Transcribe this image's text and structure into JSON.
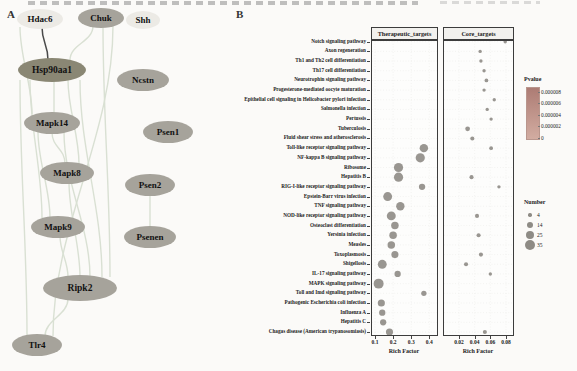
{
  "figure": {
    "panel_a_label": "A",
    "panel_b_label": "B"
  },
  "network": {
    "node_fill_default": "#a6a39b",
    "node_fill_dark": "#8a8774",
    "node_fill_light": "#eceae5",
    "node_text_color": "#111111",
    "edge_color": "#d9e0d3",
    "edge_color_dark": "#4a4a4a",
    "nodes": [
      {
        "id": "Hdac6",
        "x": 40,
        "y": 19,
        "rx": 23,
        "ry": 10,
        "variant": "light"
      },
      {
        "id": "Chuk",
        "x": 101,
        "y": 18,
        "rx": 23,
        "ry": 10,
        "variant": "default"
      },
      {
        "id": "Shh",
        "x": 143,
        "y": 20,
        "rx": 17,
        "ry": 9,
        "variant": "light"
      },
      {
        "id": "Hsp90aa1",
        "x": 52,
        "y": 70,
        "rx": 34,
        "ry": 12,
        "variant": "dark"
      },
      {
        "id": "Ncstn",
        "x": 143,
        "y": 80,
        "rx": 26,
        "ry": 11,
        "variant": "default"
      },
      {
        "id": "Mapk14",
        "x": 52,
        "y": 123,
        "rx": 28,
        "ry": 11,
        "variant": "default"
      },
      {
        "id": "Psen1",
        "x": 168,
        "y": 132,
        "rx": 25,
        "ry": 11,
        "variant": "default"
      },
      {
        "id": "Mapk8",
        "x": 67,
        "y": 173,
        "rx": 27,
        "ry": 11,
        "variant": "default"
      },
      {
        "id": "Psen2",
        "x": 150,
        "y": 185,
        "rx": 25,
        "ry": 11,
        "variant": "default"
      },
      {
        "id": "Mapk9",
        "x": 58,
        "y": 227,
        "rx": 27,
        "ry": 11,
        "variant": "default"
      },
      {
        "id": "Psenen",
        "x": 150,
        "y": 237,
        "rx": 26,
        "ry": 11,
        "variant": "default"
      },
      {
        "id": "Ripk2",
        "x": 80,
        "y": 288,
        "rx": 37,
        "ry": 13,
        "variant": "default"
      },
      {
        "id": "Tlr4",
        "x": 37,
        "y": 345,
        "rx": 25,
        "ry": 11,
        "variant": "default"
      }
    ],
    "edges": [
      {
        "from": "Hdac6",
        "to": "Hsp90aa1",
        "o1": 2,
        "o2": -4,
        "dark": true
      },
      {
        "from": "Chuk",
        "to": "Hsp90aa1",
        "o1": -8,
        "o2": 18
      },
      {
        "from": "Hsp90aa1",
        "to": "Mapk14",
        "o1": 2,
        "o2": 2
      },
      {
        "from": "Hsp90aa1",
        "to": "Mapk8",
        "o1": 16,
        "o2": 12
      },
      {
        "from": "Hsp90aa1",
        "to": "Mapk9",
        "o1": -22,
        "o2": -16
      },
      {
        "from": "Hsp90aa1",
        "to": "Ripk2",
        "o1": 28,
        "o2": 22
      },
      {
        "from": "Hsp90aa1",
        "to": "Tlr4",
        "o1": -32,
        "o2": -10
      },
      {
        "from": "Chuk",
        "to": "Ripk2",
        "o1": 2,
        "o2": 30
      },
      {
        "from": "Chuk",
        "to": "Tlr4",
        "o1": 12,
        "o2": 16
      },
      {
        "from": "Mapk14",
        "to": "Mapk8",
        "o1": 0,
        "o2": -2
      },
      {
        "from": "Mapk14",
        "to": "Mapk9",
        "o1": -14,
        "o2": -8
      },
      {
        "from": "Mapk14",
        "to": "Ripk2",
        "o1": 12,
        "o2": 10
      },
      {
        "from": "Mapk8",
        "to": "Ripk2",
        "o1": 2,
        "o2": 0
      },
      {
        "from": "Mapk9",
        "to": "Ripk2",
        "o1": 2,
        "o2": -12
      },
      {
        "from": "Ripk2",
        "to": "Tlr4",
        "o1": -12,
        "o2": 8
      },
      {
        "from": "Hdac6",
        "to": "Mapk14",
        "o1": -20,
        "o2": -20
      },
      {
        "from": "Psen2",
        "to": "Psenen",
        "o1": 0,
        "o2": 0
      }
    ]
  },
  "chart_data": {
    "type": "scatter",
    "title": "",
    "grid": true,
    "point_color": "#8e8b85",
    "facets": [
      {
        "label": "Therapeutic_targets",
        "xlabel": "Rich Factor",
        "x_ticks": [
          0.1,
          0.2,
          0.3,
          0.4
        ],
        "xlim": [
          0.08,
          0.45
        ]
      },
      {
        "label": "Core_targets",
        "xlabel": "Rich Factor",
        "x_ticks": [
          0.02,
          0.04,
          0.06,
          0.08
        ],
        "xlim": [
          0.013,
          0.09
        ]
      }
    ],
    "categories": [
      "Notch signaling pathway",
      "Axon regeneration",
      "Th1 and Th2 cell differentiation",
      "Th17 cell differentiation",
      "Neurotrophin signaling pathway",
      "Progesterone-mediated oocyte maturation",
      "Epithelial cell signaling in Helicobacter pylori infection",
      "Salmonella infection",
      "Pertussis",
      "Tuberculosis",
      "Fluid shear stress and atherosclerosis",
      "Toll-like receptor signaling pathway",
      "NF-kappa B signaling pathway",
      "Ribosome",
      "Hepatitis B",
      "RIG-I-like receptor signaling pathway",
      "Epstein-Barr virus infection",
      "TNF signaling pathway",
      "NOD-like receptor signaling pathway",
      "Osteoclast differentiation",
      "Yersinia infection",
      "Measles",
      "Toxoplasmosis",
      "Shigellosis",
      "IL-17 signaling pathway",
      "MAPK signaling pathway",
      "Toll and Imd signaling pathway",
      "Pathogenic Escherichia coli infection",
      "Influenza A",
      "Hepatitis C",
      "Chagas disease (American trypanosomiasis)"
    ],
    "series": [
      {
        "name": "Therapeutic_targets",
        "points": [
          {
            "pathway": "Toll-like receptor signaling pathway",
            "rich_factor": 0.37,
            "number": 25
          },
          {
            "pathway": "NF-kappa B signaling pathway",
            "rich_factor": 0.35,
            "number": 30
          },
          {
            "pathway": "Ribosome",
            "rich_factor": 0.23,
            "number": 30
          },
          {
            "pathway": "Hepatitis B",
            "rich_factor": 0.23,
            "number": 30
          },
          {
            "pathway": "RIG-I-like receptor signaling pathway",
            "rich_factor": 0.36,
            "number": 14
          },
          {
            "pathway": "Epstein-Barr virus infection",
            "rich_factor": 0.17,
            "number": 28
          },
          {
            "pathway": "TNF signaling pathway",
            "rich_factor": 0.24,
            "number": 25
          },
          {
            "pathway": "NOD-like receptor signaling pathway",
            "rich_factor": 0.19,
            "number": 28
          },
          {
            "pathway": "Osteoclast differentiation",
            "rich_factor": 0.21,
            "number": 20
          },
          {
            "pathway": "Yersinia infection",
            "rich_factor": 0.2,
            "number": 20
          },
          {
            "pathway": "Measles",
            "rich_factor": 0.19,
            "number": 20
          },
          {
            "pathway": "Toxoplasmosis",
            "rich_factor": 0.21,
            "number": 18
          },
          {
            "pathway": "Shigellosis",
            "rich_factor": 0.14,
            "number": 28
          },
          {
            "pathway": "IL-17 signaling pathway",
            "rich_factor": 0.225,
            "number": 14
          },
          {
            "pathway": "MAPK signaling pathway",
            "rich_factor": 0.12,
            "number": 35
          },
          {
            "pathway": "Toll and Imd signaling pathway",
            "rich_factor": 0.37,
            "number": 10
          },
          {
            "pathway": "Pathogenic Escherichia coli infection",
            "rich_factor": 0.135,
            "number": 18
          },
          {
            "pathway": "Influenza A",
            "rich_factor": 0.14,
            "number": 14
          },
          {
            "pathway": "Hepatitis C",
            "rich_factor": 0.145,
            "number": 14
          },
          {
            "pathway": "Chagas disease (American trypanosomiasis)",
            "rich_factor": 0.18,
            "number": 18
          }
        ]
      },
      {
        "name": "Core_targets",
        "points": [
          {
            "pathway": "Notch signaling pathway",
            "rich_factor": 0.079,
            "number": 4
          },
          {
            "pathway": "Axon regeneration",
            "rich_factor": 0.047,
            "number": 4
          },
          {
            "pathway": "Th1 and Th2 cell differentiation",
            "rich_factor": 0.048,
            "number": 4
          },
          {
            "pathway": "Th17 cell differentiation",
            "rich_factor": 0.052,
            "number": 4
          },
          {
            "pathway": "Neurotrophin signaling pathway",
            "rich_factor": 0.055,
            "number": 5
          },
          {
            "pathway": "Progesterone-mediated oocyte maturation",
            "rich_factor": 0.052,
            "number": 4
          },
          {
            "pathway": "Epithelial cell signaling in Helicobacter pylori infection",
            "rich_factor": 0.065,
            "number": 4
          },
          {
            "pathway": "Salmonella infection",
            "rich_factor": 0.056,
            "number": 4
          },
          {
            "pathway": "Pertussis",
            "rich_factor": 0.061,
            "number": 4
          },
          {
            "pathway": "Tuberculosis",
            "rich_factor": 0.031,
            "number": 8
          },
          {
            "pathway": "Fluid shear stress and atherosclerosis",
            "rich_factor": 0.037,
            "number": 6
          },
          {
            "pathway": "Toll-like receptor signaling pathway",
            "rich_factor": 0.061,
            "number": 5
          },
          {
            "pathway": "Hepatitis B",
            "rich_factor": 0.036,
            "number": 6
          },
          {
            "pathway": "RIG-I-like receptor signaling pathway",
            "rich_factor": 0.071,
            "number": 4
          },
          {
            "pathway": "NOD-like receptor signaling pathway",
            "rich_factor": 0.043,
            "number": 6
          },
          {
            "pathway": "Yersinia infection",
            "rich_factor": 0.045,
            "number": 6
          },
          {
            "pathway": "Toxoplasmosis",
            "rich_factor": 0.048,
            "number": 6
          },
          {
            "pathway": "Shigellosis",
            "rich_factor": 0.029,
            "number": 6
          },
          {
            "pathway": "IL-17 signaling pathway",
            "rich_factor": 0.06,
            "number": 4
          },
          {
            "pathway": "Chagas disease (American trypanosomiasis)",
            "rich_factor": 0.053,
            "number": 6
          }
        ]
      }
    ],
    "legend_pvalue": {
      "title": "Pvalue",
      "ticks": [
        "0.000008",
        "0.000006",
        "0.000004",
        "0.000002",
        "0"
      ],
      "gradient_top": "#ad7c74",
      "gradient_bottom": "#d2aca1"
    },
    "legend_number": {
      "title": "Number",
      "items": [
        4,
        14,
        25,
        35
      ]
    }
  }
}
